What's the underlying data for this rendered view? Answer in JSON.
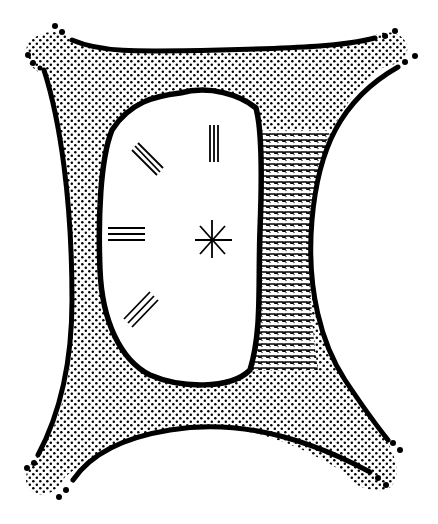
{
  "diagram": {
    "title": "",
    "background": "#ffffff",
    "ink": "#000000",
    "regions": [
      {
        "id": "stippled-matrix",
        "fill": "dot-stipple",
        "description": "four-armed stippled region surrounding central body"
      },
      {
        "id": "central-body",
        "fill": "#ffffff",
        "description": "large white oval outlined in thick black"
      },
      {
        "id": "hatched-band",
        "fill": "horizontal-dashed-hatch",
        "description": "vertical band with horizontal wavy hatching between central body and right edge"
      }
    ],
    "marks": [
      {
        "id": "triple-line-vertical",
        "type": "three-parallel-lines",
        "orientation": "vertical",
        "x": 213,
        "y": 139
      },
      {
        "id": "triple-line-diagonal-upper",
        "type": "three-parallel-lines",
        "orientation": "diagonal-down",
        "x": 148,
        "y": 167
      },
      {
        "id": "triple-line-horizontal",
        "type": "three-parallel-lines",
        "orientation": "horizontal",
        "x": 127,
        "y": 235
      },
      {
        "id": "triple-line-diagonal-lower",
        "type": "three-parallel-lines",
        "orientation": "diagonal-up",
        "x": 141,
        "y": 310
      },
      {
        "id": "asterisk-mark",
        "type": "eight-point-star",
        "x": 212,
        "y": 240
      }
    ],
    "arm_tips": [
      "top-left",
      "top-right",
      "bottom-left",
      "bottom-right"
    ]
  }
}
